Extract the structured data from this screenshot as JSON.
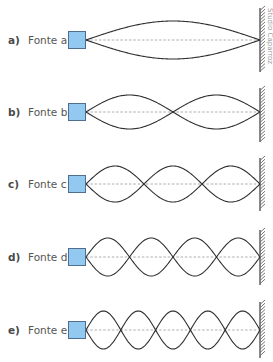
{
  "figure": {
    "colors": {
      "wave": "#2f2f2f",
      "axis_dashed": "#9a9a9a",
      "source_fill": "#93c8f0",
      "source_border": "#4f6f8f",
      "wall": "#3a3a3a",
      "label_letter": "#4a4a4a",
      "label_text": "#555555"
    },
    "wave_start_x": 86,
    "wall_x": 260,
    "credit": "Studio Caparroz",
    "rows": [
      {
        "letter": "a)",
        "name": "Fonte a",
        "center_y": 40,
        "loops": 1,
        "amplitude": 19,
        "wall_top": 8,
        "wall_bottom": 72
      },
      {
        "letter": "b)",
        "name": "Fonte b",
        "center_y": 112,
        "loops": 2,
        "amplitude": 17,
        "wall_top": 88,
        "wall_bottom": 142
      },
      {
        "letter": "c)",
        "name": "Fonte c",
        "center_y": 184,
        "loops": 3,
        "amplitude": 18,
        "wall_top": 158,
        "wall_bottom": 211
      },
      {
        "letter": "d)",
        "name": "Fonte d",
        "center_y": 257,
        "loops": 4,
        "amplitude": 19,
        "wall_top": 230,
        "wall_bottom": 285
      },
      {
        "letter": "e)",
        "name": "Fonte e",
        "center_y": 330,
        "loops": 5,
        "amplitude": 19,
        "wall_top": 302,
        "wall_bottom": 358
      }
    ]
  }
}
